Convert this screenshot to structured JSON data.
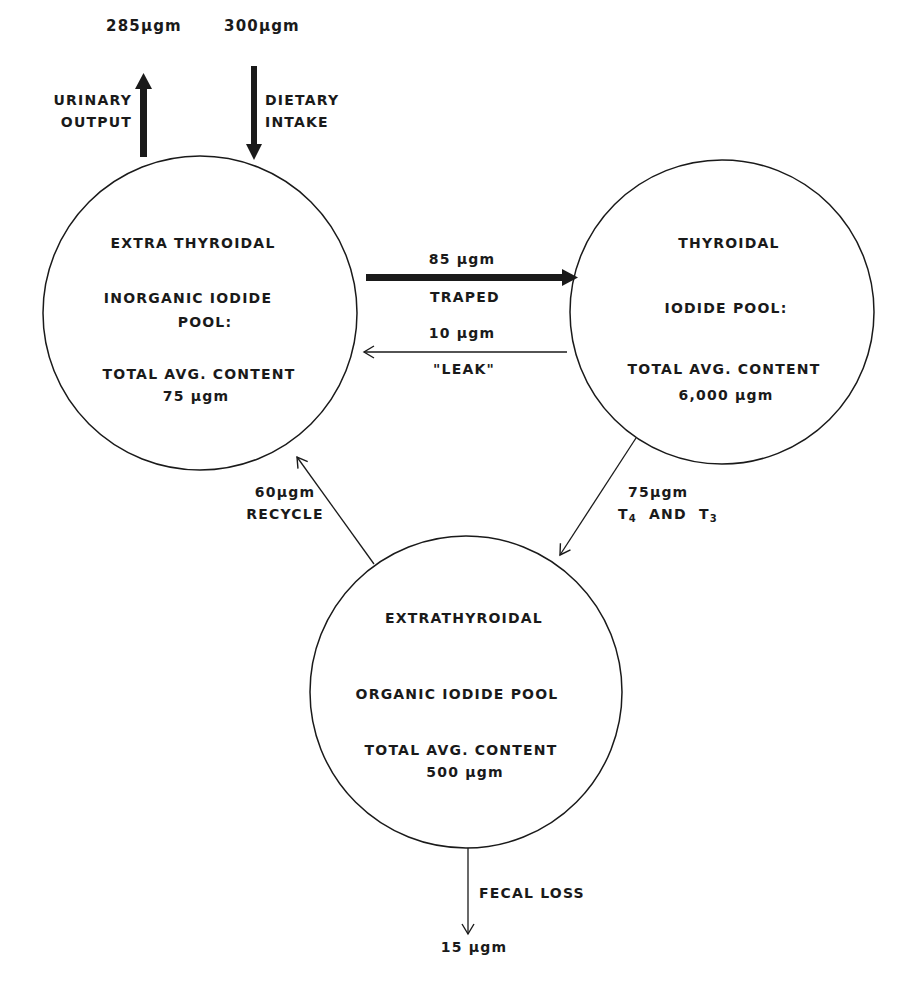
{
  "colors": {
    "ink": "#1a1a1a",
    "background": "#ffffff"
  },
  "pools": {
    "extra_inorganic": {
      "title": "EXTRA THYROIDAL",
      "line1": "INORGANIC  IODIDE",
      "line2": "POOL:",
      "content_label": "TOTAL  AVG.  CONTENT",
      "content_value": "75  μgm"
    },
    "thyroidal": {
      "title": "THYROIDAL",
      "line1": "IODIDE  POOL:",
      "content_label": "TOTAL  AVG.  CONTENT",
      "content_value": "6,000  μgm"
    },
    "extra_organic": {
      "title": "EXTRATHYROIDAL",
      "line1": "ORGANIC  IODIDE  POOL",
      "content_label": "TOTAL  AVG.  CONTENT",
      "content_value": "500  μgm"
    }
  },
  "flows": {
    "urinary": {
      "amount": "285μgm",
      "label_1": "URINARY",
      "label_2": "OUTPUT"
    },
    "dietary": {
      "amount": "300μgm",
      "label_1": "DIETARY",
      "label_2": "INTAKE"
    },
    "trapped": {
      "amount": "85 μgm",
      "label": "TRAPED"
    },
    "leak": {
      "amount": "10 μgm",
      "label": "\"LEAK\""
    },
    "recycle": {
      "amount": "60μgm",
      "label": "RECYCLE"
    },
    "hormones": {
      "amount": "75μgm",
      "label_a": "T",
      "sub_a": "4",
      "label_mid": "  AND  ",
      "label_b": "T",
      "sub_b": "3"
    },
    "fecal": {
      "amount": "15 μgm",
      "label": "FECAL  LOSS"
    }
  }
}
